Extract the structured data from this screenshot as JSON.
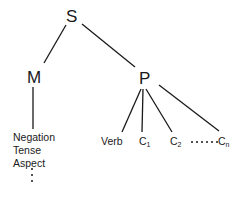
{
  "diagram": {
    "type": "tree",
    "root": {
      "label": "S",
      "children": [
        {
          "label": "M",
          "features": [
            "Negation",
            "Tense",
            "Aspect"
          ],
          "features_continue": "⋮"
        },
        {
          "label": "P",
          "children": [
            {
              "label": "Verb"
            },
            {
              "label": "C",
              "subscript": "1"
            },
            {
              "label": "C",
              "subscript": "2"
            },
            {
              "label": "C",
              "subscript": "n",
              "preceded_by": "······"
            }
          ]
        }
      ]
    },
    "line_color": "#1a1a1a"
  }
}
